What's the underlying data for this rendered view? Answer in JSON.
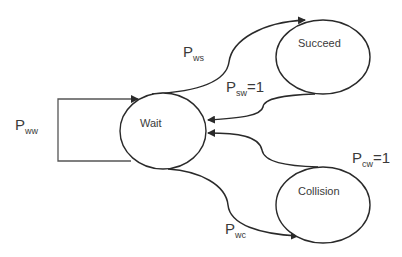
{
  "diagram": {
    "type": "state-transition",
    "states": [
      {
        "id": "wait",
        "label": "Wait"
      },
      {
        "id": "succeed",
        "label": "Succeed"
      },
      {
        "id": "collision",
        "label": "Collision"
      }
    ],
    "transitions": [
      {
        "id": "ww",
        "from": "wait",
        "to": "wait",
        "label_main": "P",
        "label_sub": "ww",
        "label_suffix": ""
      },
      {
        "id": "ws",
        "from": "wait",
        "to": "succeed",
        "label_main": "P",
        "label_sub": "ws",
        "label_suffix": ""
      },
      {
        "id": "sw",
        "from": "succeed",
        "to": "wait",
        "label_main": "P",
        "label_sub": "sw",
        "label_suffix": "=1"
      },
      {
        "id": "cw",
        "from": "collision",
        "to": "wait",
        "label_main": "P",
        "label_sub": "cw",
        "label_suffix": "=1"
      },
      {
        "id": "wc",
        "from": "wait",
        "to": "collision",
        "label_main": "P",
        "label_sub": "wc",
        "label_suffix": ""
      }
    ]
  }
}
